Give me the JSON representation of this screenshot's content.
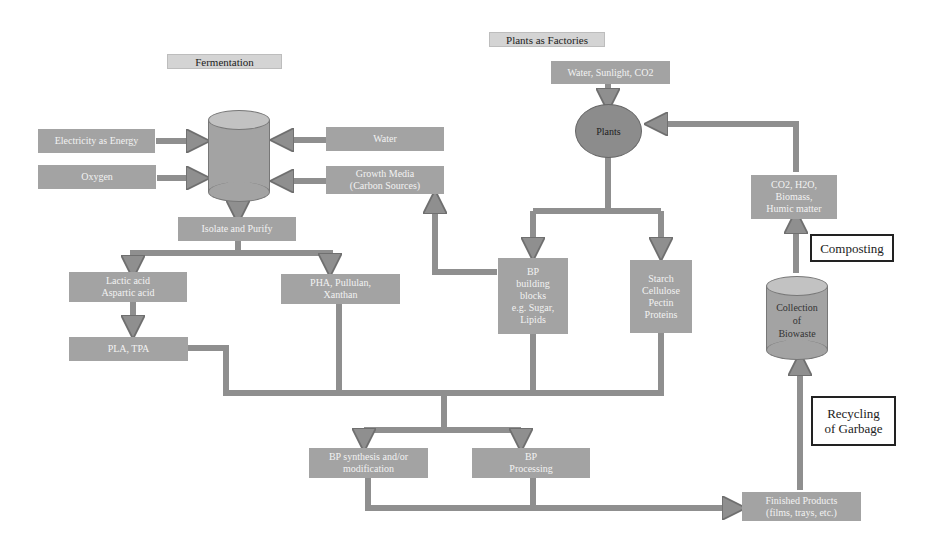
{
  "sections": {
    "fermentation": "Fermentation",
    "plants_as_factories": "Plants as Factories"
  },
  "fermentation": {
    "inputs": {
      "electricity": "Electricity as Energy",
      "oxygen": "Oxygen",
      "water": "Water",
      "growth_media_line1": "Growth Media",
      "growth_media_line2": "(Carbon Sources)"
    },
    "isolate_purify": "Isolate and Purify",
    "lactic_line1": "Lactic acid",
    "lactic_line2": "Aspartic acid",
    "pha_line1": "PHA, Pullulan,",
    "pha_line2": "Xanthan",
    "pla_tpa": "PLA, TPA"
  },
  "plants": {
    "inputs": "Water, Sunlight, CO2",
    "node": "Plants",
    "bp_blocks": [
      "BP",
      "building",
      "blocks",
      "e.g. Sugar,",
      "Lipids"
    ],
    "starch": [
      "Starch",
      "Cellulose",
      "Pectin",
      "Proteins"
    ]
  },
  "processing": {
    "synthesis_line1": "BP synthesis and/or",
    "synthesis_line2": "modification",
    "bp_processing_line1": "BP",
    "bp_processing_line2": "Processing",
    "finished_line1": "Finished Products",
    "finished_line2": "(films, trays, etc.)"
  },
  "end_of_life": {
    "compost_outputs": [
      "CO2, H2O,",
      "Biomass,",
      "Humic matter"
    ],
    "composting_label": "Composting",
    "biowaste": [
      "Collection",
      "of",
      "Biowaste"
    ],
    "recycling_line1": "Recycling",
    "recycling_line2": "of Garbage"
  },
  "colors": {
    "box_fill": "#a3a3a3",
    "connector": "#8f8f8f",
    "title_fill": "#d4d4d4"
  }
}
